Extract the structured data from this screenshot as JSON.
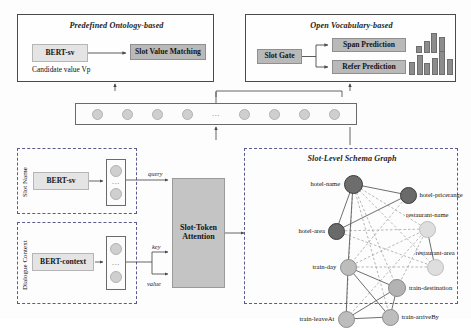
{
  "figure": {
    "top_left_panel": {
      "title": "Predefined Ontology-based",
      "encoder_label": "BERT-sv",
      "module_label": "Slot Value Matching",
      "caption": "Candidate value Vp"
    },
    "top_right_panel": {
      "title": "Open Vocabulary-based",
      "gate_label": "Slot Gate",
      "span_label": "Span Prediction",
      "refer_label": "Refer Prediction"
    },
    "token_sequence": {
      "ellipsis": "...",
      "token_count_left": 4,
      "token_count_right": 4
    },
    "slot_name_panel": {
      "side_label": "Slot Name",
      "encoder_label": "BERT-sv",
      "ellipsis": "..."
    },
    "dialogue_context_panel": {
      "side_label": "Dialogue Context",
      "encoder_label": "BERT-context",
      "ellipsis": "..."
    },
    "attention": {
      "title_line1": "Slot-Token",
      "title_line2": "Attention",
      "query_label": "query",
      "key_label": "key",
      "value_label": "value"
    },
    "schema_graph": {
      "title": "Slot-Level Schema Graph",
      "nodes": [
        {
          "id": "hotel-name",
          "label": "hotel-name",
          "x": 108,
          "y": 35,
          "r": 9.5,
          "color": "#6d6d6d",
          "stroke": "#3b3b3b",
          "label_side": "left"
        },
        {
          "id": "hotel-pricerange",
          "label": "hotel-pricerange",
          "x": 163,
          "y": 46,
          "r": 8.5,
          "color": "#6a6a6a",
          "stroke": "#3b3b3b",
          "label_side": "right"
        },
        {
          "id": "hotel-area",
          "label": "hotel-area",
          "x": 91,
          "y": 82,
          "r": 8.5,
          "color": "#6a6a6a",
          "stroke": "#3b3b3b",
          "label_side": "left"
        },
        {
          "id": "restaurant-name",
          "label": "restaurant-name",
          "x": 182,
          "y": 80,
          "r": 8.5,
          "color": "#dedede",
          "stroke": "#bdbdbd",
          "label_side": "above"
        },
        {
          "id": "restaurant-area",
          "label": "restaurant-area",
          "x": 190,
          "y": 118,
          "r": 8.5,
          "color": "#dedede",
          "stroke": "#bdbdbd",
          "label_side": "above"
        },
        {
          "id": "train-day",
          "label": "train-day",
          "x": 103,
          "y": 118,
          "r": 8.5,
          "color": "#bdbdbd",
          "stroke": "#8e8e8e",
          "label_side": "left"
        },
        {
          "id": "train-destination",
          "label": "train-destination",
          "x": 152,
          "y": 139,
          "r": 9,
          "color": "#b3b3b3",
          "stroke": "#8a8a8a",
          "label_side": "right"
        },
        {
          "id": "train-leaveAt",
          "label": "train-leaveAt",
          "x": 101,
          "y": 170,
          "r": 8.5,
          "color": "#bdbdbd",
          "stroke": "#8e8e8e",
          "label_side": "left"
        },
        {
          "id": "train-arriveBy",
          "label": "train-arriveBy",
          "x": 145,
          "y": 168,
          "r": 8.5,
          "color": "#bdbdbd",
          "stroke": "#8e8e8e",
          "label_side": "right"
        }
      ],
      "solid_edges": [
        [
          "hotel-name",
          "hotel-pricerange"
        ],
        [
          "hotel-name",
          "hotel-area"
        ],
        [
          "hotel-name",
          "train-day"
        ],
        [
          "hotel-area",
          "hotel-pricerange"
        ],
        [
          "restaurant-name",
          "restaurant-area"
        ],
        [
          "train-day",
          "train-destination"
        ],
        [
          "train-day",
          "train-leaveAt"
        ],
        [
          "train-day",
          "train-arriveBy"
        ],
        [
          "train-leaveAt",
          "train-destination"
        ],
        [
          "train-leaveAt",
          "train-arriveBy"
        ],
        [
          "train-arriveBy",
          "train-destination"
        ]
      ],
      "dashed_edges": [
        [
          "hotel-name",
          "restaurant-name"
        ],
        [
          "hotel-name",
          "restaurant-area"
        ],
        [
          "hotel-name",
          "train-destination"
        ],
        [
          "hotel-name",
          "train-leaveAt"
        ],
        [
          "hotel-name",
          "train-arriveBy"
        ],
        [
          "hotel-area",
          "restaurant-name"
        ],
        [
          "hotel-area",
          "restaurant-area"
        ],
        [
          "hotel-pricerange",
          "train-day"
        ],
        [
          "restaurant-name",
          "train-day"
        ],
        [
          "restaurant-name",
          "train-destination"
        ],
        [
          "restaurant-name",
          "train-leaveAt"
        ],
        [
          "train-day",
          "restaurant-area"
        ]
      ]
    },
    "mini_charts": [
      {
        "name": "span-prediction-chart",
        "bars": [
          4,
          8,
          13,
          11
        ]
      },
      {
        "name": "refer-prediction-chart",
        "bars": [
          9,
          14,
          8,
          12,
          17,
          11
        ]
      }
    ]
  }
}
